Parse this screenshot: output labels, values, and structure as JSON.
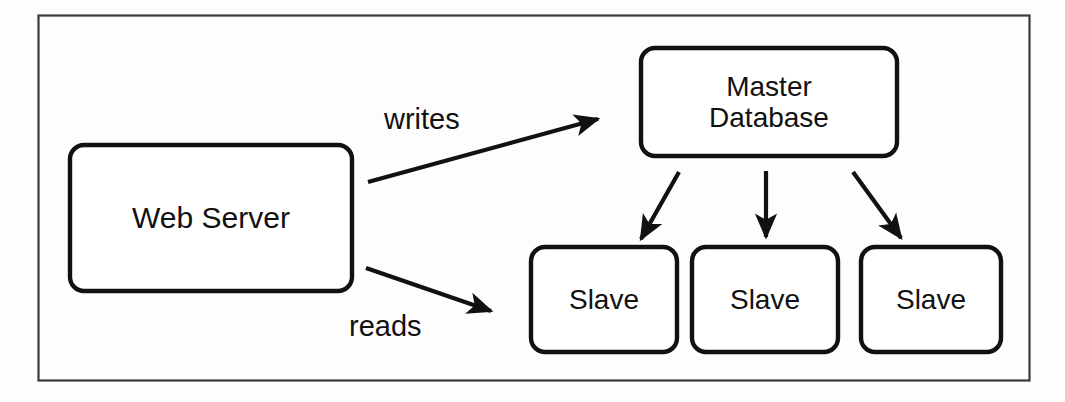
{
  "figure": {
    "frame": {
      "name": "outer-border"
    },
    "colors": {
      "stroke": "#111111",
      "fill": "#ffffff",
      "background": "#fdfdfd",
      "text": "#111111"
    }
  },
  "nodes": [
    {
      "id": "web-server",
      "label": "Web Server",
      "shape": "rounded-rectangle",
      "x": 70,
      "y": 145,
      "w": 282,
      "h": 146,
      "font_size": 30
    },
    {
      "id": "master-database",
      "label": "Master\nDatabase",
      "shape": "rounded-rectangle",
      "x": 641,
      "y": 48,
      "w": 256,
      "h": 108,
      "font_size": 28
    },
    {
      "id": "slave-1",
      "label": "Slave",
      "shape": "rounded-rectangle",
      "x": 531,
      "y": 247,
      "w": 146,
      "h": 105,
      "font_size": 28
    },
    {
      "id": "slave-2",
      "label": "Slave",
      "shape": "rounded-rectangle",
      "x": 692,
      "y": 247,
      "w": 146,
      "h": 105,
      "font_size": 28
    },
    {
      "id": "slave-3",
      "label": "Slave",
      "shape": "rounded-rectangle",
      "x": 861,
      "y": 247,
      "w": 140,
      "h": 105,
      "font_size": 28
    }
  ],
  "edges": [
    {
      "id": "writes-edge",
      "label": "writes",
      "from": "web-server",
      "to": "master-database",
      "x1": 368,
      "y1": 182,
      "x2": 604,
      "y2": 117
    },
    {
      "id": "reads-edge",
      "label": "reads",
      "from": "web-server",
      "to": "slave-1",
      "x1": 366,
      "y1": 268,
      "x2": 497,
      "y2": 314
    },
    {
      "id": "replicate-edge-1",
      "label": "",
      "from": "master-database",
      "to": "slave-1",
      "x1": 679,
      "y1": 172,
      "x2": 637,
      "y2": 246
    },
    {
      "id": "replicate-edge-2",
      "label": "",
      "from": "master-database",
      "to": "slave-2",
      "x1": 766,
      "y1": 171,
      "x2": 766,
      "y2": 246
    },
    {
      "id": "replicate-edge-3",
      "label": "",
      "from": "master-database",
      "to": "slave-3",
      "x1": 853,
      "y1": 172,
      "x2": 906,
      "y2": 245
    }
  ],
  "edge_labels": [
    {
      "id": "writes-label",
      "text": "writes",
      "x": 384,
      "y": 105
    },
    {
      "id": "reads-label",
      "text": "reads",
      "x": 349,
      "y": 312
    }
  ]
}
